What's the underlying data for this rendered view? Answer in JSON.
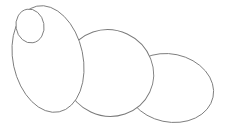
{
  "drawing": {
    "description": "Line sketch of overlapping ellipses (caterpillar/body segments)",
    "background": "#ffffff",
    "stroke_color": "#7a7a7a",
    "shapes": [
      {
        "id": "tail-segment",
        "type": "ellipse",
        "cx": 170,
        "cy": 88,
        "rx": 44,
        "ry": 34,
        "rotate": 12
      },
      {
        "id": "middle-segment",
        "type": "ellipse",
        "cx": 109,
        "cy": 73,
        "rx": 45,
        "ry": 43,
        "rotate": 25
      },
      {
        "id": "body-segment",
        "type": "ellipse",
        "cx": 48,
        "cy": 59,
        "rx": 35,
        "ry": 54,
        "rotate": -12
      },
      {
        "id": "head-circle",
        "type": "ellipse",
        "cx": 30,
        "cy": 26,
        "rx": 14,
        "ry": 17,
        "rotate": -10
      }
    ]
  }
}
